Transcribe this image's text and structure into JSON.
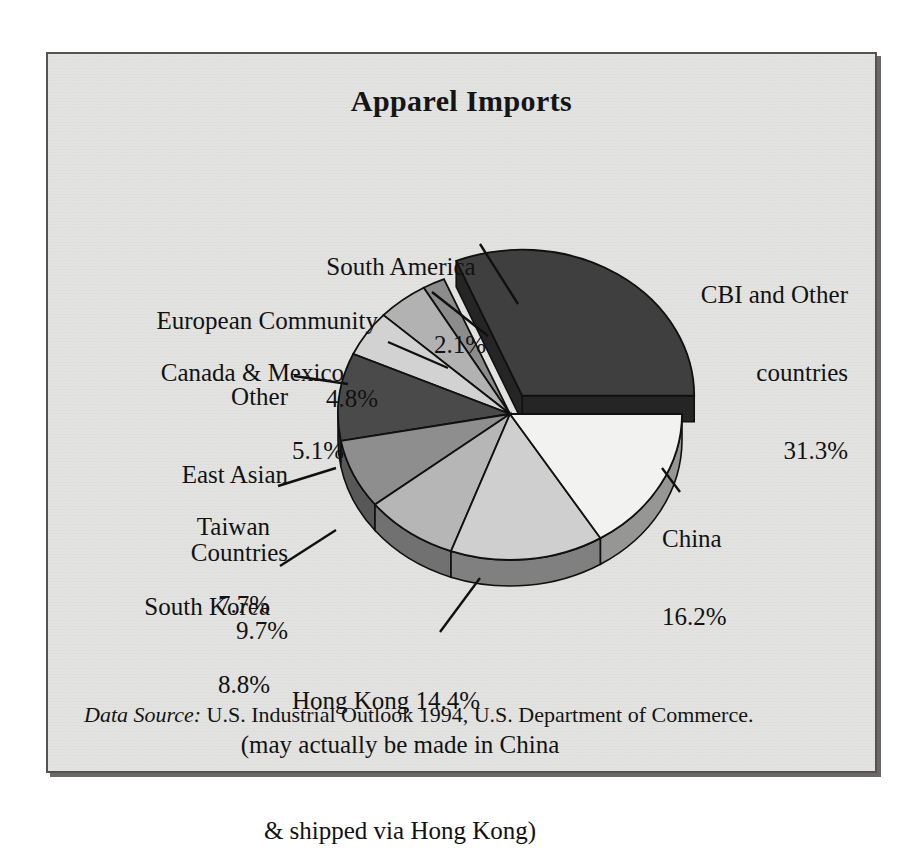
{
  "figure": {
    "title": "Apparel Imports",
    "source_prefix": "Data Source:",
    "source_text": " U.S. Industrial Outlook 1994, U.S. Department of Commerce.",
    "note_line1": "(may actually be made in China",
    "note_line2": "& shipped via Hong Kong)",
    "background": "#e2e2e0",
    "frame_color": "#555250"
  },
  "labels": {
    "south_america": {
      "name": "South America",
      "pct": "2.1%"
    },
    "european_community": {
      "name": "European Community",
      "pct": "4.8%"
    },
    "canada_mexico": {
      "name": "Canada & Mexico",
      "pct": "5.1%"
    },
    "other_east_asian": {
      "l1": "Other",
      "l2": "East Asian",
      "l3": "Countries",
      "pct": "9.7%"
    },
    "taiwan": {
      "name": "Taiwan",
      "pct": "7.7%"
    },
    "south_korea": {
      "name": "South Korea",
      "pct": "8.8%"
    },
    "hong_kong": {
      "name": "Hong Kong 14.4%"
    },
    "china": {
      "name": "China",
      "pct": "16.2%"
    },
    "cbi": {
      "l1": "CBI and Other",
      "l2": "countries",
      "pct": "31.3%"
    }
  },
  "chart_data": {
    "type": "pie",
    "title": "Apparel Imports",
    "subtitle": "",
    "xlabel": "",
    "ylabel": "",
    "units": "percent of U.S. apparel imports",
    "legend": "none-labels-with-leader-lines",
    "exploded_slice": "CBI and Other countries",
    "three_d": true,
    "start_angle_deg": 0,
    "direction": "counterclockwise",
    "categories": [
      "CBI and Other countries",
      "South America",
      "European Community",
      "Canada & Mexico",
      "Other East Asian Countries",
      "Taiwan",
      "South Korea",
      "Hong Kong",
      "China"
    ],
    "values": [
      31.3,
      2.1,
      4.8,
      5.1,
      9.7,
      7.7,
      8.8,
      14.4,
      16.2
    ],
    "labels": [
      "CBI and Other countries 31.3%",
      "South America 2.1%",
      "European Community 4.8%",
      "Canada & Mexico 5.1%",
      "Other East Asian Countries 9.7%",
      "Taiwan 7.7%",
      "South Korea 8.8%",
      "Hong Kong 14.4%",
      "China 16.2%"
    ],
    "colors": [
      "#3f3f3f",
      "#8c8c8c",
      "#b2b2b2",
      "#d2d2d2",
      "#4a4a4a",
      "#8e8e8e",
      "#b6b6b6",
      "#cfcfcf",
      "#f2f2f0"
    ],
    "total": 100.1,
    "annotations": [
      "(may actually be made in China & shipped via Hong Kong)"
    ],
    "source": "Data Source: U.S. Industrial Outlook 1994, U.S. Department of Commerce."
  }
}
